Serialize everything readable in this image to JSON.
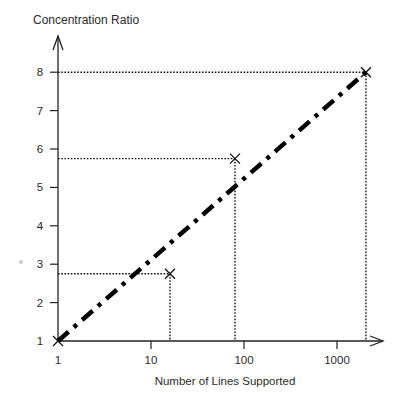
{
  "chart_data": {
    "type": "line",
    "title": "",
    "xlabel": "Number of Lines Supported",
    "ylabel": "Concentration Ratio",
    "x_scale": "log",
    "xlim": [
      1,
      2500
    ],
    "ylim": [
      1,
      8.6
    ],
    "x_ticks": [
      1,
      10,
      100,
      1000
    ],
    "x_tick_labels": [
      "1",
      "10",
      "100",
      "1000"
    ],
    "y_ticks": [
      1,
      2,
      3,
      4,
      5,
      6,
      7,
      8
    ],
    "y_tick_labels": [
      "1",
      "2",
      "3",
      "4",
      "5",
      "6",
      "7",
      "8"
    ],
    "grid": false,
    "legend": null,
    "series": [
      {
        "name": "trend",
        "style": "dash-dot",
        "color": "#000000",
        "x": [
          1,
          2048
        ],
        "y": [
          1,
          8
        ]
      },
      {
        "name": "points",
        "style": "x-marker",
        "color": "#000000",
        "x": [
          1,
          16,
          80,
          2048
        ],
        "y": [
          1,
          2.75,
          5.75,
          8
        ]
      }
    ],
    "guides": [
      {
        "x": 16,
        "y": 2.75
      },
      {
        "x": 80,
        "y": 5.75
      },
      {
        "x": 2048,
        "y": 8
      }
    ]
  }
}
